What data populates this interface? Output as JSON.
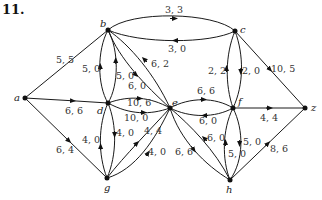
{
  "problem_number": "11.",
  "nodes": {
    "a": {
      "label": "a",
      "x": 25,
      "y": 98
    },
    "b": {
      "label": "b",
      "x": 108,
      "y": 30
    },
    "c": {
      "label": "c",
      "x": 235,
      "y": 31
    },
    "d": {
      "label": "d",
      "x": 108,
      "y": 103
    },
    "e": {
      "label": "e",
      "x": 170,
      "y": 108
    },
    "f": {
      "label": "f",
      "x": 233,
      "y": 108
    },
    "z": {
      "label": "z",
      "x": 305,
      "y": 108
    },
    "g": {
      "label": "g",
      "x": 107,
      "y": 178
    },
    "h": {
      "label": "h",
      "x": 230,
      "y": 180
    }
  },
  "edges": [
    {
      "id": "a-b",
      "from": "a",
      "to": "b",
      "label": "5, 5"
    },
    {
      "id": "a-d",
      "from": "a",
      "to": "d",
      "label": "6, 6"
    },
    {
      "id": "a-g",
      "from": "a",
      "to": "g",
      "label": "6, 4"
    },
    {
      "id": "b-c-top",
      "from": "b",
      "to": "c",
      "label": "3, 3"
    },
    {
      "id": "c-b-bottom",
      "from": "c",
      "to": "b",
      "label": "3, 0"
    },
    {
      "id": "d-b-left",
      "from": "d",
      "to": "b",
      "label": "5, 0"
    },
    {
      "id": "b-d-right",
      "from": "b",
      "to": "d",
      "label": "5, 0"
    },
    {
      "id": "e-b-outer",
      "from": "e",
      "to": "b",
      "label": "6, 2"
    },
    {
      "id": "b-e-inner",
      "from": "b",
      "to": "e",
      "label": "6, 0"
    },
    {
      "id": "d-e-top",
      "from": "d",
      "to": "e",
      "label": "10, 6"
    },
    {
      "id": "e-d-bottom",
      "from": "e",
      "to": "d",
      "label": "10, 0"
    },
    {
      "id": "g-d-left",
      "from": "g",
      "to": "d",
      "label": "4, 0"
    },
    {
      "id": "d-g-right",
      "from": "d",
      "to": "g",
      "label": "4, 0"
    },
    {
      "id": "g-e-top",
      "from": "g",
      "to": "e",
      "label": "4, 4"
    },
    {
      "id": "e-g-bottom",
      "from": "e",
      "to": "g",
      "label": "4, 0"
    },
    {
      "id": "e-f-top",
      "from": "e",
      "to": "f",
      "label": "6, 6"
    },
    {
      "id": "f-e-bottom",
      "from": "f",
      "to": "e",
      "label": "6, 0"
    },
    {
      "id": "f-c-left",
      "from": "f",
      "to": "c",
      "label": "2, 2"
    },
    {
      "id": "c-f-right",
      "from": "c",
      "to": "f",
      "label": "2, 0"
    },
    {
      "id": "c-z",
      "from": "c",
      "to": "z",
      "label": "10, 5"
    },
    {
      "id": "f-z",
      "from": "f",
      "to": "z",
      "label": "4, 4"
    },
    {
      "id": "e-h-outer",
      "from": "e",
      "to": "h",
      "label": "6, 6"
    },
    {
      "id": "h-e-inner",
      "from": "h",
      "to": "e",
      "label": "6, 0"
    },
    {
      "id": "h-f-left",
      "from": "h",
      "to": "f",
      "label": "5, 0"
    },
    {
      "id": "f-h-right",
      "from": "f",
      "to": "h",
      "label": "5, 0"
    },
    {
      "id": "h-z",
      "from": "h",
      "to": "z",
      "label": "8, 6"
    }
  ]
}
